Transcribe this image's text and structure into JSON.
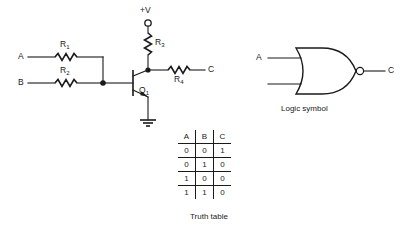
{
  "circuit": {
    "title_labels": {
      "supply": "+V",
      "input_a": "A",
      "input_b": "B",
      "output_c": "C",
      "r1": "R",
      "r1_sub": "1",
      "r2": "R",
      "r2_sub": "2",
      "r3": "R",
      "r3_sub": "3",
      "r4": "R",
      "r4_sub": "4",
      "transistor": "Q",
      "transistor_sub": "1"
    }
  },
  "logic_symbol": {
    "caption": "Logic symbol",
    "input_a": "A",
    "input_b": "B",
    "output_c": "C",
    "gate_type": "NOR"
  },
  "truth_table": {
    "caption": "Truth table",
    "headers": [
      "A",
      "B",
      "C"
    ],
    "rows": [
      [
        "0",
        "0",
        "1"
      ],
      [
        "0",
        "1",
        "0"
      ],
      [
        "1",
        "0",
        "0"
      ],
      [
        "1",
        "1",
        "0"
      ]
    ]
  },
  "colors": {
    "ink": "#1a1a1a",
    "background": "#ffffff"
  }
}
